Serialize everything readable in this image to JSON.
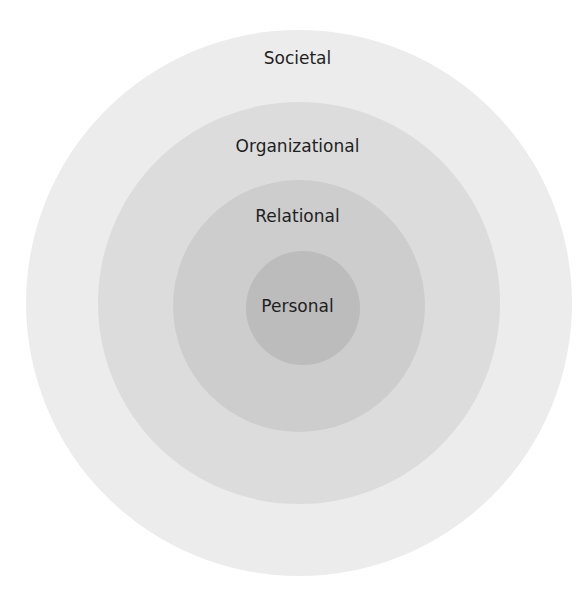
{
  "diagram": {
    "title": "",
    "type": "concentric circles",
    "layers": [
      {
        "label": "Societal",
        "color": "#ececec"
      },
      {
        "label": "Organizational",
        "color": "#dcdcdc"
      },
      {
        "label": "Relational",
        "color": "#cdcdcd"
      },
      {
        "label": "Personal",
        "color": "#bcbcbc"
      }
    ]
  }
}
